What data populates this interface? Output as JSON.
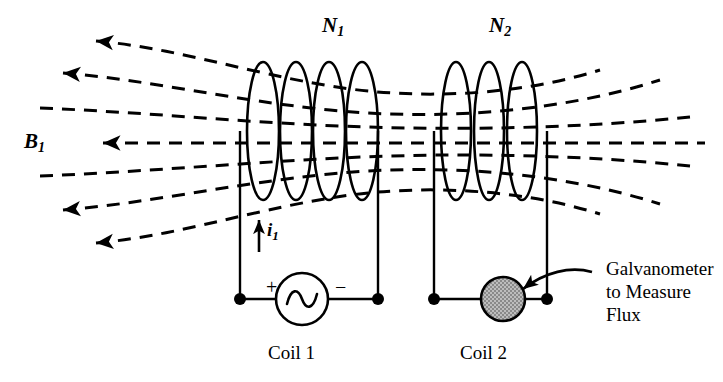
{
  "figure": {
    "background_color": "#ffffff",
    "ink_color": "#000000"
  },
  "labels": {
    "coil1_turns": "N",
    "coil1_turns_sub": "1",
    "coil2_turns": "N",
    "coil2_turns_sub": "2",
    "field": "B",
    "field_sub": "1",
    "current": "i",
    "current_sub": "1",
    "plus": "+",
    "minus": "−",
    "coil1_caption": "Coil 1",
    "coil2_caption": "Coil 2",
    "galvanometer_line1": "Galvanometer",
    "galvanometer_line2": "to Measure",
    "galvanometer_line3": "Flux"
  },
  "components": {
    "source": {
      "type": "ac-source",
      "symbol": "sine-wave",
      "cx": 302,
      "cy": 299,
      "r": 26
    },
    "galvanometer": {
      "type": "galvanometer",
      "fill_color": "#a9a9a9",
      "stroke_color": "#000000",
      "cx": 503,
      "cy": 299,
      "r": 22
    },
    "terminals": [
      {
        "name": "coil1-left-terminal",
        "cx": 240,
        "cy": 299
      },
      {
        "name": "coil1-right-terminal",
        "cx": 378,
        "cy": 299
      },
      {
        "name": "coil2-left-terminal",
        "cx": 434,
        "cy": 299
      },
      {
        "name": "coil2-right-terminal",
        "cx": 547,
        "cy": 299
      }
    ],
    "coil1": {
      "turns": 4,
      "centers_x": [
        263,
        296,
        329,
        362
      ],
      "cy": 131,
      "rx": 16,
      "ry": 69
    },
    "coil2": {
      "turns": 3,
      "centers_x": [
        456,
        489,
        522
      ],
      "cy": 131,
      "rx": 15,
      "ry": 69
    }
  },
  "flux_lines": {
    "count": 7,
    "style": "dashed",
    "dash_pattern": "13 9",
    "stroke_width": 3,
    "arrow_direction": "left",
    "arrows": 5,
    "description": "Magnetic field lines B1 spread from coil 1 through coil 2, arrowheads on the left pointing outward"
  },
  "annotation_arrow": {
    "name": "galvanometer-callout-arrow",
    "from": "Galvanometer to Measure Flux",
    "to": "galvanometer"
  }
}
